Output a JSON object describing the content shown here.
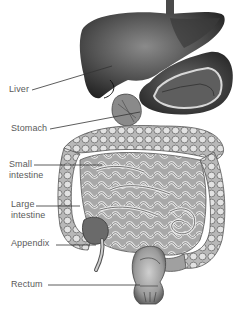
{
  "diagram": {
    "labels": [
      {
        "id": "liver",
        "text": "Liver"
      },
      {
        "id": "stomach",
        "text": "Stomach"
      },
      {
        "id": "small-intestine",
        "line1": "Small",
        "line2": "intestine"
      },
      {
        "id": "large-intestine",
        "line1": "Large",
        "line2": "intestine"
      },
      {
        "id": "appendix",
        "text": "Appendix"
      },
      {
        "id": "rectum",
        "text": "Rectum"
      }
    ],
    "colors": {
      "background": "#ffffff",
      "label_text": "#5a5a5a",
      "leader_line": "#333333",
      "organ_dark": "#3a3a3a",
      "organ_mid": "#8a8a8a",
      "organ_light": "#d8d8d8"
    }
  }
}
